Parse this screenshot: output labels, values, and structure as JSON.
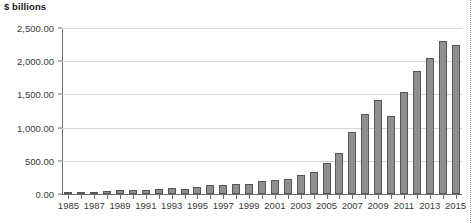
{
  "chart_data": {
    "type": "bar",
    "title": "$ billions",
    "xlabel": "",
    "ylabel": "$ billions",
    "ylim": [
      0,
      2500
    ],
    "ytick_step": 500,
    "ytick_labels": [
      "0.00",
      "500.00",
      "1,000.00",
      "1,500.00",
      "2,000.00",
      "2,500.00"
    ],
    "ytick_values": [
      0,
      500,
      1000,
      1500,
      2000,
      2500
    ],
    "grid": true,
    "legend": null,
    "categories": [
      "1985",
      "1986",
      "1987",
      "1988",
      "1989",
      "1990",
      "1991",
      "1992",
      "1993",
      "1994",
      "1995",
      "1996",
      "1997",
      "1998",
      "1999",
      "2000",
      "2001",
      "2002",
      "2003",
      "2004",
      "2005",
      "2006",
      "2007",
      "2008",
      "2009",
      "2010",
      "2011",
      "2012",
      "2013",
      "2014",
      "2015"
    ],
    "xtick_labels_shown": [
      "1985",
      "1987",
      "1989",
      "1991",
      "1993",
      "1995",
      "1997",
      "1999",
      "2001",
      "2003",
      "2005",
      "2007",
      "2009",
      "2011",
      "2013",
      "2015"
    ],
    "values": [
      20,
      30,
      35,
      50,
      60,
      55,
      60,
      70,
      90,
      80,
      100,
      130,
      140,
      150,
      150,
      190,
      210,
      230,
      280,
      330,
      470,
      620,
      940,
      1200,
      1410,
      1180,
      1530,
      1860,
      2050,
      2300,
      2250
    ],
    "bar_color": "#8f8f8f",
    "bar_edge_color": "#565656",
    "gridline_color": "#d6d6d6",
    "axis_color": "#6e6e6e"
  }
}
